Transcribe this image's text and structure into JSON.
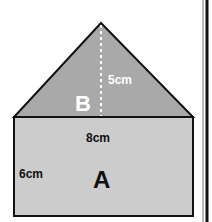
{
  "diagram": {
    "colors": {
      "triangle_fill": "#a9a9a9",
      "rectangle_fill": "#cccccc",
      "outline": "#111111",
      "background": "#ffffff"
    },
    "shapes": {
      "triangle": {
        "label": "B",
        "height_label": "5cm"
      },
      "rectangle": {
        "label": "A",
        "width_label": "8cm",
        "height_label": "6cm"
      }
    }
  }
}
